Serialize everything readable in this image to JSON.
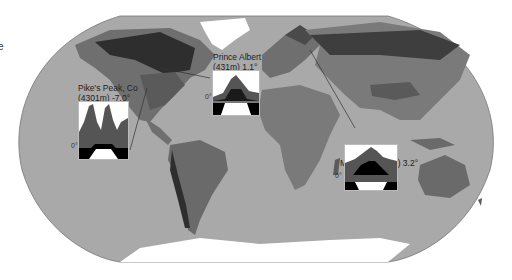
{
  "figure": {
    "edge_fragment": "e",
    "colors": {
      "ocean": "#a9a9a9",
      "land_base": "#8c8c8c",
      "land_mid": "#6f6f6f",
      "land_dark": "#4a4a4a",
      "land_darkest": "#2e2e2e",
      "ice": "#ffffff",
      "leader_line": "#333333"
    }
  },
  "insets": [
    {
      "name": "pikes-peak",
      "label_line1": "Pike's Peak, Co",
      "label_line2": "(4301m) -7.0°",
      "zero_label": "0°"
    },
    {
      "name": "prince-albert",
      "label_line1": "Prince Albert",
      "label_line2": "(431m) 1.1°",
      "zero_label": "0°"
    },
    {
      "name": "moscow",
      "label_line1": "Moscow (167m) 3.2°",
      "label_line2": "",
      "zero_label": "0°"
    }
  ]
}
